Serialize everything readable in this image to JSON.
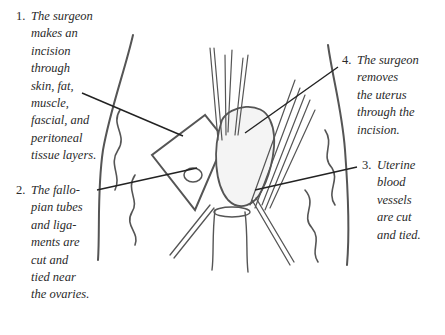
{
  "diagram": {
    "type": "medical-illustration",
    "labels": [
      {
        "number": "1.",
        "lines": [
          "The surgeon",
          "makes an",
          "incision",
          "through",
          "skin, fat,",
          "muscle,",
          "fascial, and",
          "peritoneal",
          "tissue layers."
        ]
      },
      {
        "number": "2.",
        "lines": [
          "The fallo-",
          "pian tubes",
          "and liga-",
          "ments are",
          "cut and",
          "tied near",
          "the ovaries."
        ]
      },
      {
        "number": "3.",
        "lines": [
          "Uterine",
          "blood",
          "vessels",
          "are cut",
          "and tied."
        ]
      },
      {
        "number": "4.",
        "lines": [
          "The surgeon",
          "removes",
          "the uterus",
          "through the",
          "incision."
        ]
      }
    ],
    "colors": {
      "ink": "#2a2a2a",
      "sketch": "#555555",
      "background": "#ffffff"
    }
  }
}
